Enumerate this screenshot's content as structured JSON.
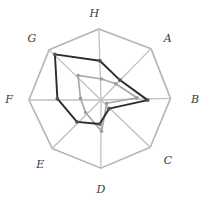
{
  "chart_data": {
    "type": "radar",
    "title": "",
    "subtitle": "",
    "xlabel": "",
    "ylabel": "",
    "grid": true,
    "grid_shape": "octagon",
    "grid_rings": 1,
    "legend": "none",
    "axes": [
      "A",
      "B",
      "C",
      "D",
      "E",
      "F",
      "G",
      "H"
    ],
    "axis_angles_deg": [
      45,
      0,
      -45,
      -90,
      -135,
      180,
      135,
      90
    ],
    "rmin": 0,
    "rmax": 1.0,
    "tick_labels": [],
    "categories": [
      "A",
      "B",
      "C",
      "D",
      "E",
      "F",
      "G",
      "H"
    ],
    "series": [
      {
        "name": "Series 1",
        "color": "#2b2b2b",
        "style": "solid",
        "marker": "dot",
        "values": [
          0.4,
          0.7,
          0.18,
          0.34,
          0.45,
          0.62,
          0.92,
          0.56
        ]
      },
      {
        "name": "Series 2",
        "color": "#a9a9a9",
        "style": "solid",
        "marker": "dot",
        "values": [
          0.3,
          0.52,
          0.1,
          0.46,
          0.3,
          0.3,
          0.46,
          0.28
        ]
      }
    ],
    "annotations": []
  },
  "labels": {
    "A": "A",
    "B": "B",
    "C": "C",
    "D": "D",
    "E": "E",
    "F": "F",
    "G": "G",
    "H": "H"
  },
  "colors": {
    "grid": "#b4b4b4",
    "spoke": "#c0c0c0",
    "series_dark": "#2b2b2b",
    "series_light": "#a9a9a9",
    "label": "#3a3a3a",
    "background": "#ffffff"
  },
  "geometry": {
    "center_x": 101,
    "center_y": 100,
    "radius": 70,
    "label_radius": 86
  }
}
